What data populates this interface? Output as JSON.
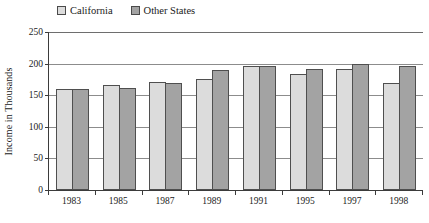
{
  "legend": {
    "position": "top-left",
    "entries": [
      {
        "label": "California",
        "color": "#dcdcdc",
        "swatch_name": "legend-swatch-california"
      },
      {
        "label": "Other States",
        "color": "#a3a3a3",
        "swatch_name": "legend-swatch-other-states"
      }
    ]
  },
  "axes": {
    "y_title": "Income in Thousands",
    "y_ticks": [
      "0",
      "50",
      "100",
      "150",
      "200",
      "250"
    ],
    "x_ticks": [
      "1983",
      "1985",
      "1987",
      "1989",
      "1991",
      "1995",
      "1997",
      "1998"
    ]
  },
  "chart_data": {
    "type": "bar",
    "title": "",
    "xlabel": "",
    "ylabel": "Income in Thousands",
    "ylim": [
      0,
      250
    ],
    "ytick_step": 50,
    "grid": true,
    "legend_position": "top-left",
    "categories": [
      "1983",
      "1985",
      "1987",
      "1989",
      "1991",
      "1995",
      "1997",
      "1998"
    ],
    "series": [
      {
        "name": "California",
        "color": "#dcdcdc",
        "values": [
          160,
          166,
          171,
          175,
          196,
          184,
          192,
          170
        ]
      },
      {
        "name": "Other States",
        "color": "#a3a3a3",
        "values": [
          160,
          162,
          169,
          190,
          196,
          192,
          200,
          197
        ]
      }
    ]
  }
}
